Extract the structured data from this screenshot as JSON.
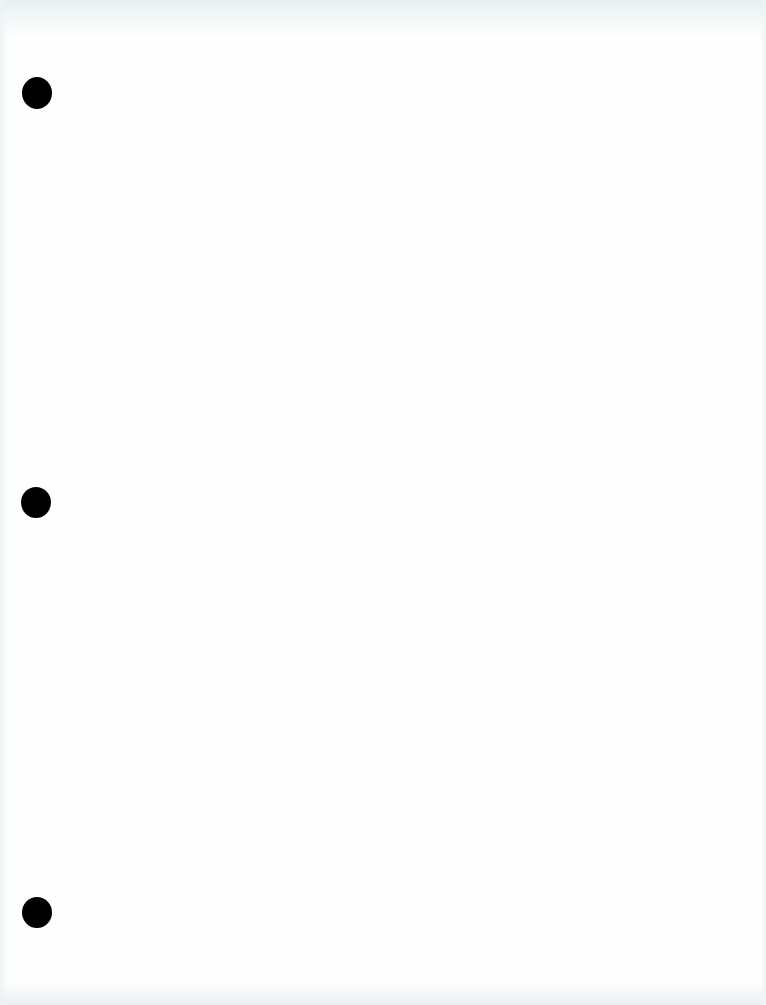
{
  "document": {
    "type": "blank scanned page",
    "text": "",
    "background_color": "#fefefe",
    "edge_shading_color": "#e6eef0",
    "hole_punches": [
      {
        "cx": 37,
        "cy": 93,
        "w": 30,
        "h": 32,
        "color": "#000000"
      },
      {
        "cx": 36,
        "cy": 502,
        "w": 30,
        "h": 31,
        "color": "#000000"
      },
      {
        "cx": 37,
        "cy": 912,
        "w": 30,
        "h": 31,
        "color": "#000000"
      }
    ]
  }
}
